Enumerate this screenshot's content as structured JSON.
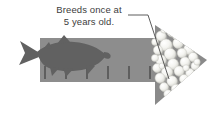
{
  "figure": {
    "background_color": "#ffffff",
    "width": 219,
    "height": 116
  },
  "annotation": {
    "text": "Breeds once at\n5 years old.",
    "line1": "Breeds once at",
    "line2": "5 years old.",
    "text_color": "#3d3d3d",
    "leader_line_color": "#4a4a4a",
    "points_to": "egg-cluster"
  },
  "arrow": {
    "name": "timeline-arrow",
    "body_color": "#8d8d8d",
    "head_color": "#8a8a8a",
    "direction": "right",
    "body": {
      "x": 40,
      "y": 38,
      "width": 127,
      "height": 44
    },
    "head": {
      "left": 155,
      "top": 25,
      "bottom": 105,
      "tip_x": 207,
      "tip_y": 60
    },
    "tick_color": "#5e5e5e",
    "tick_count": 6,
    "tick_x_positions": [
      45,
      66,
      87,
      108,
      129,
      150
    ],
    "tick_top": 66,
    "tick_height": 13
  },
  "fish": {
    "name": "salmon-silhouette",
    "color": "#616161",
    "facing": "left",
    "bounds": {
      "x": 18,
      "y": 40,
      "width": 90,
      "height": 36
    }
  },
  "eggs": {
    "name": "egg-cluster",
    "count": 38,
    "fill_color": "#f2f2ee",
    "edge_color": "#cfcfc9",
    "shadow_color": "#b8b8b2",
    "region": {
      "x": 152,
      "y": 28,
      "width": 50,
      "height": 68
    },
    "circles": [
      {
        "cx": 161,
        "cy": 36,
        "r": 5.0
      },
      {
        "cx": 172,
        "cy": 31,
        "r": 5.6
      },
      {
        "cx": 183,
        "cy": 35,
        "r": 5.0
      },
      {
        "cx": 193,
        "cy": 41,
        "r": 4.4
      },
      {
        "cx": 166,
        "cy": 45,
        "r": 6.0
      },
      {
        "cx": 178,
        "cy": 43,
        "r": 5.2
      },
      {
        "cx": 189,
        "cy": 49,
        "r": 5.4
      },
      {
        "cx": 158,
        "cy": 50,
        "r": 4.6
      },
      {
        "cx": 170,
        "cy": 54,
        "r": 5.8
      },
      {
        "cx": 182,
        "cy": 53,
        "r": 4.8
      },
      {
        "cx": 193,
        "cy": 57,
        "r": 4.6
      },
      {
        "cx": 161,
        "cy": 60,
        "r": 5.2
      },
      {
        "cx": 173,
        "cy": 64,
        "r": 5.4
      },
      {
        "cx": 185,
        "cy": 62,
        "r": 5.0
      },
      {
        "cx": 195,
        "cy": 66,
        "r": 4.0
      },
      {
        "cx": 157,
        "cy": 68,
        "r": 4.4
      },
      {
        "cx": 167,
        "cy": 72,
        "r": 5.6
      },
      {
        "cx": 179,
        "cy": 71,
        "r": 5.0
      },
      {
        "cx": 190,
        "cy": 73,
        "r": 4.4
      },
      {
        "cx": 160,
        "cy": 78,
        "r": 5.0
      },
      {
        "cx": 172,
        "cy": 81,
        "r": 5.2
      },
      {
        "cx": 184,
        "cy": 79,
        "r": 4.6
      },
      {
        "cx": 164,
        "cy": 87,
        "r": 4.4
      },
      {
        "cx": 176,
        "cy": 89,
        "r": 4.8
      },
      {
        "cx": 187,
        "cy": 86,
        "r": 4.0
      },
      {
        "cx": 168,
        "cy": 94,
        "r": 4.2
      },
      {
        "cx": 179,
        "cy": 96,
        "r": 3.8
      },
      {
        "cx": 155,
        "cy": 58,
        "r": 3.6
      },
      {
        "cx": 198,
        "cy": 50,
        "r": 3.4
      },
      {
        "cx": 188,
        "cy": 32,
        "r": 3.6
      },
      {
        "cx": 176,
        "cy": 36,
        "r": 3.4
      },
      {
        "cx": 164,
        "cy": 30,
        "r": 3.2
      },
      {
        "cx": 155,
        "cy": 42,
        "r": 3.4
      },
      {
        "cx": 197,
        "cy": 62,
        "r": 3.2
      },
      {
        "cx": 192,
        "cy": 80,
        "r": 3.2
      },
      {
        "cx": 171,
        "cy": 100,
        "r": 3.0
      },
      {
        "cx": 162,
        "cy": 66,
        "r": 3.0
      },
      {
        "cx": 186,
        "cy": 68,
        "r": 3.2
      }
    ]
  }
}
